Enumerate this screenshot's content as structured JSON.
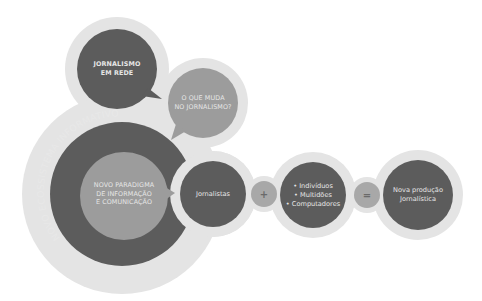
{
  "diagram": {
    "colors": {
      "background": "#ffffff",
      "halo": "#e4e4e4",
      "dark": "#5c5c5c",
      "mid": "#9c9c9c",
      "operator": "#a8a8a8",
      "text": "#e6e6e6"
    },
    "top_bubble": {
      "lines": [
        "JORNALISMO",
        "EM REDE"
      ]
    },
    "question_bubble": {
      "lines": [
        "O QUE MUDA",
        "NO JORNALISMO?"
      ]
    },
    "ecosystem": {
      "ring_label": "NOVO ECOSSISTEMA INFORMATIVO",
      "inner_lines": [
        "NOVO PARADIGMA",
        "DE INFORMAÇÃO",
        "E COMUNICAÇÃO"
      ]
    },
    "equation": {
      "term1": "Jornalistas",
      "plus": "+",
      "term2_lines": [
        "• Indivíduos",
        "• Multidões",
        "• Computadores"
      ],
      "equals": "=",
      "result_lines": [
        "Nova produção",
        "Jornalística"
      ]
    }
  }
}
